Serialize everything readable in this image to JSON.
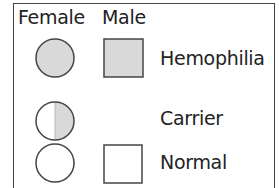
{
  "legend": {
    "headers": {
      "female": "Female",
      "male": "Male"
    },
    "rows": [
      {
        "label": "Hemophilia",
        "female_symbol": "filled-circle",
        "male_symbol": "filled-square"
      },
      {
        "label": "Carrier",
        "female_symbol": "half-filled-circle",
        "male_symbol": null
      },
      {
        "label": "Normal",
        "female_symbol": "empty-circle",
        "male_symbol": "empty-square"
      }
    ],
    "colors": {
      "fill": "#d9d9d9",
      "stroke": "#444444"
    }
  }
}
